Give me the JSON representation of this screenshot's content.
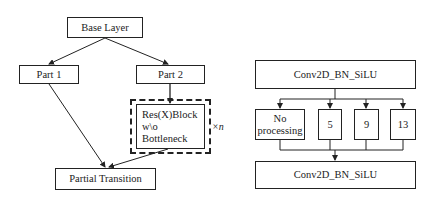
{
  "left_diagram": {
    "base_layer": "Base Layer",
    "part1": "Part 1",
    "part2": "Part 2",
    "resblock_lines": [
      "Res(X)Block",
      "w\\o",
      "Bottleneck"
    ],
    "repeat_label": "×n",
    "partial_transition": "Partial Transition"
  },
  "right_diagram": {
    "top_block": "Conv2D_BN_SiLU",
    "branches": [
      {
        "label_lines": [
          "No",
          "processing"
        ]
      },
      {
        "label": "5"
      },
      {
        "label": "9"
      },
      {
        "label": "13"
      }
    ],
    "bottom_block": "Conv2D_BN_SiLU"
  },
  "colors": {
    "stroke": "#222222",
    "background": "#ffffff"
  }
}
